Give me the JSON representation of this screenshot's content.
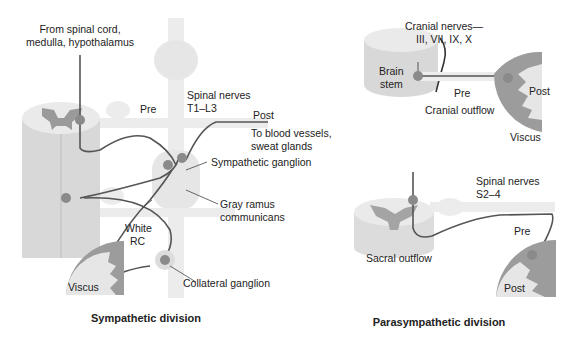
{
  "sympathetic": {
    "caption": "Sympathetic division",
    "labels": {
      "from_line1": "From spinal cord,",
      "from_line2": "medulla, hypothalamus",
      "pre": "Pre",
      "spinal_line1": "Spinal nerves",
      "spinal_line2": "T1–L3",
      "post": "Post",
      "blood_line1": "To blood vessels,",
      "blood_line2": "sweat glands",
      "sympathetic_ganglion": "Sympathetic ganglion",
      "gray_line1": "Gray ramus",
      "gray_line2": "communicans",
      "white_line1": "White",
      "white_line2": "RC",
      "viscus": "Viscus",
      "collateral_ganglion": "Collateral ganglion"
    }
  },
  "parasympathetic": {
    "caption": "Parasympathetic division",
    "labels": {
      "cranial_line1": "Cranial nerves—",
      "cranial_line2": "III, VII, IX, X",
      "brain_line1": "Brain",
      "brain_line2": "stem",
      "pre_top": "Pre",
      "post_top": "Post",
      "cranial_outflow": "Cranial outflow",
      "viscus": "Viscus",
      "spinal_line1": "Spinal nerves",
      "spinal_line2": "S2–4",
      "pre_bottom": "Pre",
      "sacral_outflow": "Sacral outflow",
      "post_bottom": "Post"
    }
  },
  "colors": {
    "cord_light": "#e8e8e8",
    "cord_mid": "#d4d4d4",
    "gray_matter": "#9a9a9a",
    "nerve_line": "#555555",
    "neuron": "#8a8a8a",
    "viscus_outer": "#9c9c9c",
    "viscus_inner": "#e6e6e6"
  }
}
